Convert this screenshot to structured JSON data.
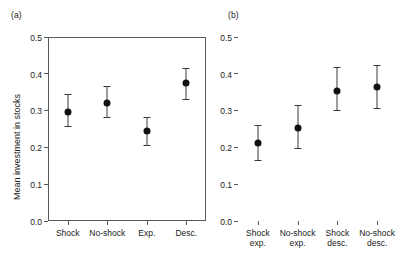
{
  "figure": {
    "panels": [
      {
        "label": "(a)",
        "ylabel": "Mean investment in stocks"
      },
      {
        "label": "(b)",
        "ylabel": ""
      }
    ]
  },
  "chart_data": [
    {
      "type": "scatter",
      "title": "(a)",
      "xlabel": "",
      "ylabel": "Mean investment in stocks",
      "ylim": [
        0.0,
        0.5
      ],
      "yticks": [
        "0.0",
        "0.1",
        "0.2",
        "0.3",
        "0.4",
        "0.5"
      ],
      "grid": false,
      "legend": "none",
      "categories": [
        "Shock",
        "No-shock",
        "Exp.",
        "Desc."
      ],
      "category_lines": [
        [
          "Shock"
        ],
        [
          "No-shock"
        ],
        [
          "Exp."
        ],
        [
          "Desc."
        ]
      ],
      "values": [
        0.296,
        0.322,
        0.244,
        0.374
      ],
      "error_low": [
        0.259,
        0.283,
        0.206,
        0.332
      ],
      "error_high": [
        0.344,
        0.366,
        0.283,
        0.417
      ]
    },
    {
      "type": "scatter",
      "title": "(b)",
      "xlabel": "",
      "ylabel": "",
      "ylim": [
        0.0,
        0.5
      ],
      "yticks": [
        "0.0",
        "0.1",
        "0.2",
        "0.3",
        "0.4",
        "0.5"
      ],
      "grid": false,
      "legend": "none",
      "categories": [
        "Shock exp.",
        "No-shock exp.",
        "Shock desc.",
        "No-shock desc."
      ],
      "category_lines": [
        [
          "Shock",
          "exp."
        ],
        [
          "No-shock",
          "exp."
        ],
        [
          "Shock",
          "desc."
        ],
        [
          "No-shock",
          "desc."
        ]
      ],
      "values": [
        0.213,
        0.253,
        0.353,
        0.365
      ],
      "error_low": [
        0.167,
        0.198,
        0.301,
        0.308
      ],
      "error_high": [
        0.262,
        0.316,
        0.418,
        0.423
      ]
    }
  ]
}
